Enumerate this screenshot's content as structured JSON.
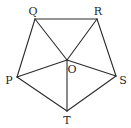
{
  "figure": {
    "type": "pentagon-with-center",
    "background": "#ffffff",
    "stroke_color": "#2b2b2b",
    "points": {
      "Q": {
        "x": 35,
        "y": 19
      },
      "R": {
        "x": 97,
        "y": 19
      },
      "S": {
        "x": 116,
        "y": 76
      },
      "T": {
        "x": 67,
        "y": 111
      },
      "P": {
        "x": 17,
        "y": 77
      },
      "O": {
        "x": 67,
        "y": 60
      }
    },
    "labels": {
      "Q": "Q",
      "R": "R",
      "S": "S",
      "T": "T",
      "P": "P",
      "O": "O"
    },
    "label_positions": {
      "Q": {
        "x": 33,
        "y": 15
      },
      "R": {
        "x": 98,
        "y": 15
      },
      "S": {
        "x": 123,
        "y": 84
      },
      "T": {
        "x": 67,
        "y": 124
      },
      "P": {
        "x": 9,
        "y": 84
      },
      "O": {
        "x": 72,
        "y": 73
      }
    },
    "edges": [
      [
        "Q",
        "R"
      ],
      [
        "R",
        "S"
      ],
      [
        "S",
        "T"
      ],
      [
        "T",
        "P"
      ],
      [
        "P",
        "Q"
      ],
      [
        "O",
        "Q"
      ],
      [
        "O",
        "R"
      ],
      [
        "O",
        "S"
      ],
      [
        "O",
        "T"
      ],
      [
        "O",
        "P"
      ]
    ]
  }
}
